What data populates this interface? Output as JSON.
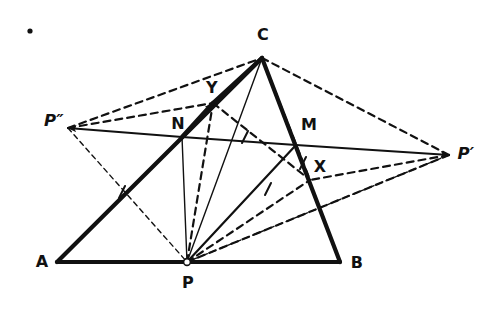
{
  "figure": {
    "background_color": "#ffffff",
    "ink_color": "#111111",
    "stray_mark": {
      "name": "stray-dot",
      "x": 30,
      "y": 31,
      "r": 2.6
    },
    "labels": [
      {
        "id": "A",
        "text": "A",
        "x": 42,
        "y": 262
      },
      {
        "id": "B",
        "text": "B",
        "x": 357,
        "y": 263
      },
      {
        "id": "C",
        "text": "C",
        "x": 263,
        "y": 35
      },
      {
        "id": "P",
        "text": "P",
        "x": 188,
        "y": 283
      },
      {
        "id": "N",
        "text": "N",
        "x": 178,
        "y": 124
      },
      {
        "id": "M",
        "text": "M",
        "x": 309,
        "y": 125
      },
      {
        "id": "X",
        "text": "X",
        "x": 320,
        "y": 167
      },
      {
        "id": "Y",
        "text": "Y",
        "x": 212,
        "y": 88
      },
      {
        "id": "Pp",
        "text": "P′",
        "x": 466,
        "y": 154
      },
      {
        "id": "Ppp",
        "text": "P″",
        "x": 54,
        "y": 121
      }
    ],
    "points": [
      {
        "id": "A",
        "x": 57,
        "y": 262
      },
      {
        "id": "B",
        "x": 340,
        "y": 262
      },
      {
        "id": "C",
        "x": 262,
        "y": 58
      },
      {
        "id": "P",
        "x": 187,
        "y": 262
      },
      {
        "id": "N",
        "x": 182,
        "y": 137
      },
      {
        "id": "M",
        "x": 296,
        "y": 145
      },
      {
        "id": "X",
        "x": 310,
        "y": 180
      },
      {
        "id": "Y",
        "x": 213,
        "y": 103
      },
      {
        "id": "Pp",
        "x": 449,
        "y": 155
      },
      {
        "id": "Ppp",
        "x": 68,
        "y": 128
      }
    ],
    "segments": [
      {
        "name": "side-AB",
        "from": "A",
        "to": "B",
        "style": "solid",
        "weight": "thick"
      },
      {
        "name": "side-AC",
        "from": "A",
        "to": "C",
        "style": "solid",
        "weight": "thick"
      },
      {
        "name": "side-CB",
        "from": "C",
        "to": "B",
        "style": "solid",
        "weight": "thick"
      },
      {
        "name": "segment-P-N",
        "from": "P",
        "to": "N",
        "style": "solid",
        "weight": "thin"
      },
      {
        "name": "segment-P-C",
        "from": "P",
        "to": "C",
        "style": "solid",
        "weight": "thin"
      },
      {
        "name": "segment-P-M",
        "from": "P",
        "to": "M",
        "style": "solid",
        "weight": "medium"
      },
      {
        "name": "segment-P-Y",
        "from": "P",
        "to": "Y",
        "style": "dashed",
        "weight": "medium"
      },
      {
        "name": "segment-P-X",
        "from": "P",
        "to": "X",
        "style": "dashed",
        "weight": "medium"
      },
      {
        "name": "segment-N-Y",
        "from": "N",
        "to": "Y",
        "style": "solid",
        "weight": "thick"
      },
      {
        "name": "segment-Y-C",
        "from": "Y",
        "to": "C",
        "style": "solid",
        "weight": "thick"
      },
      {
        "name": "segment-Y-X",
        "from": "Y",
        "to": "X",
        "style": "dashed",
        "weight": "medium"
      },
      {
        "name": "segment-C-X",
        "from": "C",
        "to": "X",
        "style": "dashed",
        "weight": "medium"
      },
      {
        "name": "segment-N-Ppp-ray",
        "from": "N",
        "to": "Ppp",
        "style": "solid",
        "weight": "medium"
      },
      {
        "name": "segment-N-M",
        "from": "N",
        "to": "M",
        "style": "solid",
        "weight": "medium"
      },
      {
        "name": "segment-M-Pp-ray",
        "from": "M",
        "to": "Pp",
        "style": "solid",
        "weight": "medium"
      },
      {
        "name": "dashed-Ppp-C",
        "from": "Ppp",
        "to": "C",
        "style": "dashed",
        "weight": "medium"
      },
      {
        "name": "dashed-Ppp-Y",
        "from": "Ppp",
        "to": "Y",
        "style": "dashed",
        "weight": "medium"
      },
      {
        "name": "dashed-Ppp-P",
        "from": "Ppp",
        "to": "P",
        "style": "dashed",
        "weight": "thin"
      },
      {
        "name": "dashed-Pp-C",
        "from": "Pp",
        "to": "C",
        "style": "dashed",
        "weight": "medium"
      },
      {
        "name": "dashed-Pp-X",
        "from": "Pp",
        "to": "X",
        "style": "dashed",
        "weight": "medium"
      },
      {
        "name": "dashed-Pp-P",
        "from": "Pp",
        "to": "P",
        "style": "dashed",
        "weight": "medium"
      },
      {
        "name": "dashed-Pp-P-lower",
        "from": "Pp",
        "to": "P",
        "style": "dashed",
        "weight": "thin"
      }
    ],
    "arrows": [
      {
        "name": "arrowhead-at-Pprime",
        "at": "Pp"
      },
      {
        "name": "arrowhead-at-Pdoubleprime",
        "at": "Ppp"
      },
      {
        "name": "arrowhead-at-Y",
        "at": "Y"
      }
    ],
    "tick_marks": [
      {
        "name": "tick-on-AC",
        "x": 122,
        "y": 192
      },
      {
        "name": "tick-on-NC",
        "x": 245,
        "y": 137
      },
      {
        "name": "tick-on-PM",
        "x": 268,
        "y": 189
      },
      {
        "name": "tick-on-CB",
        "x": 303,
        "y": 163
      }
    ]
  }
}
